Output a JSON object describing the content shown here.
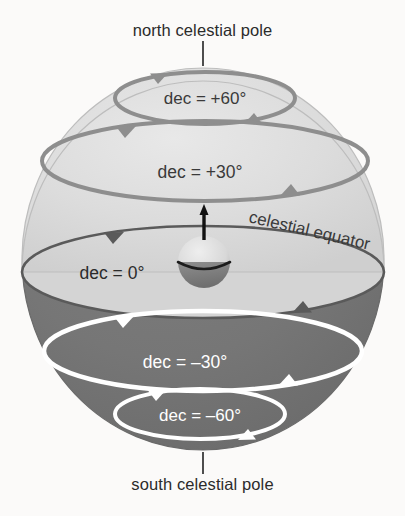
{
  "figure": {
    "title_visible": false,
    "background_color": "#fbfaf9",
    "sphere": {
      "northern_fill": "#dcdcdc",
      "southern_fill": "#767676",
      "equator_plane_fill": "#d2d2d2",
      "outline_color": "#b9b9b9"
    },
    "labels": {
      "north_pole": "north celestial pole",
      "south_pole": "south celestial pole",
      "celestial_equator": "celestial equator"
    },
    "earth": {
      "name": "earth-globe",
      "axis_arrow": "rotation-axis-arrow"
    }
  },
  "chart_data": {
    "type": "diagram",
    "title": "",
    "annotations": [
      "north celestial pole",
      "south celestial pole",
      "celestial equator"
    ],
    "declination_circles": [
      {
        "label": "dec = +60°",
        "value": 60,
        "stroke": "#8e8e8e",
        "text_color": "#3a3a3a",
        "cx": 205,
        "cy": 98,
        "rx": 90,
        "ry": 26
      },
      {
        "label": "dec = +30°",
        "value": 30,
        "stroke": "#8e8e8e",
        "text_color": "#3a3a3a",
        "cx": 205,
        "cy": 161,
        "rx": 163,
        "ry": 40
      },
      {
        "label": "dec = 0°",
        "value": 0,
        "stroke": "#5a5a5a",
        "text_color": "#2b2b2b",
        "cx": 203,
        "cy": 272,
        "rx": 181,
        "ry": 46
      },
      {
        "label": "dec = –30°",
        "value": -30,
        "stroke": "#ffffff",
        "text_color": "#ffffff",
        "cx": 203,
        "cy": 351,
        "rx": 159,
        "ry": 40
      },
      {
        "label": "dec = –60°",
        "value": -60,
        "stroke": "#ffffff",
        "text_color": "#ffffff",
        "cx": 200,
        "cy": 414,
        "rx": 85,
        "ry": 25
      }
    ],
    "axis_ranges": {
      "declination_min": -60,
      "declination_max": 60,
      "step": 30
    },
    "grid": false,
    "legend": "none"
  }
}
